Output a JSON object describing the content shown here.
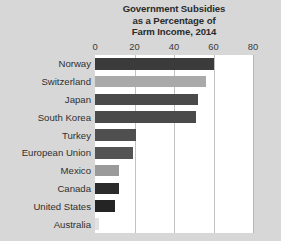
{
  "chart_data": {
    "type": "bar",
    "orientation": "horizontal",
    "title": "Government Subsidies as a Percentage of Farm Income, 2014",
    "title_lines": [
      "Government Subsidies",
      "as a Percentage of",
      "Farm Income, 2014"
    ],
    "xlabel": "",
    "ylabel": "",
    "xlim": [
      0,
      80
    ],
    "xticks": [
      0,
      20,
      40,
      60,
      80
    ],
    "xtick_labels": [
      "0",
      "20",
      "40",
      "60",
      "80"
    ],
    "grid": "vertical",
    "legend": "none",
    "categories": [
      "Norway",
      "Switzerland",
      "Japan",
      "South Korea",
      "Turkey",
      "European Union",
      "Mexico",
      "Canada",
      "United States",
      "Australia"
    ],
    "values": [
      60,
      56,
      52,
      51,
      21,
      19,
      12,
      12,
      10,
      2
    ],
    "bar_colors": [
      "#3b3b3b",
      "#a9a9a9",
      "#4a4a4a",
      "#4a4a4a",
      "#4f4f4f",
      "#545454",
      "#9a9a9a",
      "#2b2b2b",
      "#242424",
      "#e2e2e2"
    ]
  },
  "style": {
    "figure_background": "#d7d7d7",
    "plot_background": "#ffffff",
    "gridline_color": "#c2c2c2",
    "title_color": "#2b2b2b",
    "tick_color": "#3a3a3a",
    "label_color": "#2f2f2f"
  }
}
